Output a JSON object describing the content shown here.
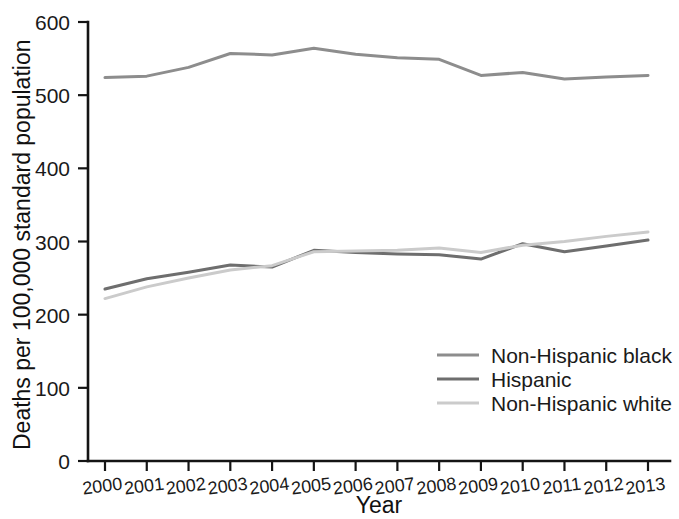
{
  "chart_data": {
    "type": "line",
    "title": "",
    "xlabel": "Year",
    "ylabel": "Deaths per 100,000 standard population",
    "x": [
      2000,
      2001,
      2002,
      2003,
      2004,
      2005,
      2006,
      2007,
      2008,
      2009,
      2010,
      2011,
      2012,
      2013
    ],
    "xtick_labels": [
      "2000",
      "2001",
      "2002",
      "2003",
      "2004",
      "2005",
      "2006",
      "2007",
      "2008",
      "2009",
      "2010",
      "2011",
      "2012",
      "2013"
    ],
    "ytick_labels": [
      "0",
      "100",
      "200",
      "300",
      "400",
      "500",
      "600"
    ],
    "ytick_values": [
      0,
      100,
      200,
      300,
      400,
      500,
      600
    ],
    "ylim": [
      0,
      600
    ],
    "xlim": [
      2000,
      2013
    ],
    "grid": false,
    "legend_position": "lower-right-inside",
    "series": [
      {
        "name": "Non-Hispanic black",
        "color": "#8d8d8d",
        "values": [
          524,
          526,
          538,
          557,
          555,
          564,
          556,
          551,
          549,
          527,
          531,
          522,
          525,
          527
        ]
      },
      {
        "name": "Hispanic",
        "color": "#6e6e6e",
        "values": [
          235,
          249,
          258,
          268,
          265,
          288,
          285,
          283,
          282,
          276,
          297,
          286,
          294,
          302
        ]
      },
      {
        "name": "Non-Hispanic white",
        "color": "#cbcbcb",
        "values": [
          222,
          238,
          250,
          261,
          267,
          286,
          287,
          288,
          291,
          285,
          295,
          300,
          307,
          313
        ]
      }
    ]
  },
  "legend": {
    "entries": [
      {
        "label": "Non-Hispanic black"
      },
      {
        "label": "Hispanic"
      },
      {
        "label": "Non-Hispanic white"
      }
    ]
  },
  "axes": {
    "x_title": "Year",
    "y_title": "Deaths per 100,000 standard population"
  }
}
